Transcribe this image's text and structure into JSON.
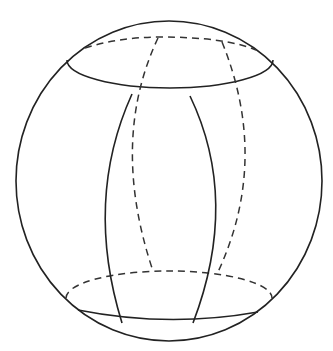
{
  "figure": {
    "title_fragment": "physical",
    "colors": {
      "background": "#ffffff",
      "ink": "#222222"
    },
    "outer_sphere": {
      "cx": 169,
      "cy": 181,
      "rx": 153,
      "ry": 160
    },
    "top_circle": {
      "cx": 170,
      "cy": 66,
      "rx": 103,
      "ry": 28
    },
    "bottom_circle": {
      "cx": 169,
      "cy": 298,
      "rx": 103,
      "ry": 27
    },
    "meridians": [
      {
        "name": "front-left",
        "style": "solid"
      },
      {
        "name": "front-right",
        "style": "solid"
      },
      {
        "name": "back-left",
        "style": "dashed"
      },
      {
        "name": "back-right",
        "style": "dashed"
      }
    ]
  }
}
